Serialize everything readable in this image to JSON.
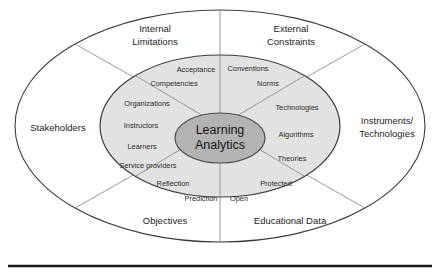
{
  "diagram": {
    "core": {
      "line1": "Learning",
      "line2": "Analytics"
    },
    "outer_labels": [
      {
        "id": "internal-limitations",
        "line1": "Internal",
        "line2": "Limitations"
      },
      {
        "id": "external-constraints",
        "line1": "External",
        "line2": "Constraints"
      },
      {
        "id": "stakeholders",
        "line1": "Stakeholders",
        "line2": ""
      },
      {
        "id": "instruments-technologies",
        "line1": "Instruments/",
        "line2": "Technologies"
      },
      {
        "id": "objectives",
        "line1": "Objectives",
        "line2": ""
      },
      {
        "id": "educational-data",
        "line1": "Educational Data",
        "line2": ""
      }
    ],
    "inner_labels": [
      {
        "id": "acceptance",
        "text": "Acceptance"
      },
      {
        "id": "competencies",
        "text": "Competencies"
      },
      {
        "id": "organizations",
        "text": "Organizations"
      },
      {
        "id": "instructors",
        "text": "Instructors"
      },
      {
        "id": "learners",
        "text": "Learners"
      },
      {
        "id": "service-providers",
        "text": "Service providers"
      },
      {
        "id": "reflection",
        "text": "Reflection"
      },
      {
        "id": "prediction",
        "text": "Prediction"
      },
      {
        "id": "open",
        "text": "Open"
      },
      {
        "id": "protected",
        "text": "Protected"
      },
      {
        "id": "theories",
        "text": "Theories"
      },
      {
        "id": "algorithms",
        "text": "Algorithms"
      },
      {
        "id": "technologies",
        "text": "Technologies"
      },
      {
        "id": "norms",
        "text": "Norms"
      },
      {
        "id": "conventions",
        "text": "Conventions"
      }
    ],
    "colors": {
      "outer_fill": "#ffffff",
      "inner_fill": "#e2e2e2",
      "core_fill": "#b3b3b3",
      "stroke": "#3a3a3a",
      "divider": "#8f8f8f",
      "rule": "#1a1a1a"
    }
  }
}
